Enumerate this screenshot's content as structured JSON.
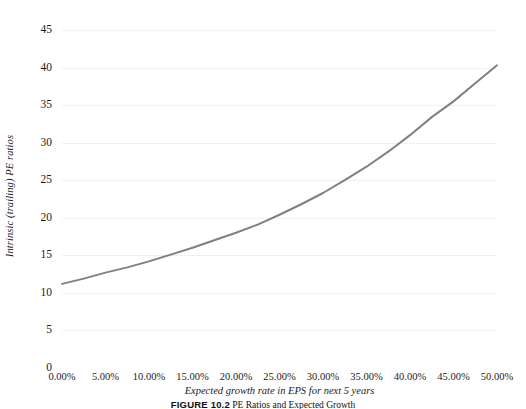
{
  "figure": {
    "caption_number": "FIGURE 10.2",
    "caption_text": "PE Ratios and Expected Growth"
  },
  "chart_data": {
    "type": "line",
    "title": "",
    "xlabel": "Expected growth rate in EPS for next 5 years",
    "ylabel": "Intrinsic (trailing) PE ratios",
    "xlim": [
      0,
      50
    ],
    "ylim": [
      0,
      45
    ],
    "grid": true,
    "legend": "none",
    "line_color": "#808080",
    "x_tick_labels": [
      "0.00%",
      "5.00%",
      "10.00%",
      "15.00%",
      "20.00%",
      "25.00%",
      "30.00%",
      "35.00%",
      "40.00%",
      "45.00%",
      "50.00%"
    ],
    "y_tick_labels": [
      "0",
      "5",
      "10",
      "15",
      "20",
      "25",
      "30",
      "35",
      "40",
      "45"
    ],
    "x": [
      0,
      2.5,
      5,
      7.5,
      10,
      12.5,
      15,
      17.5,
      20,
      22.5,
      25,
      27.5,
      30,
      32.5,
      35,
      37.5,
      40,
      42.5,
      45,
      47.5,
      50
    ],
    "series": [
      {
        "name": "Intrinsic (trailing) PE ratio",
        "values": [
          11.2,
          11.9,
          12.7,
          13.4,
          14.2,
          15.1,
          16.0,
          17.0,
          18.0,
          19.1,
          20.4,
          21.8,
          23.3,
          25.0,
          26.8,
          28.8,
          31.0,
          33.4,
          35.5,
          37.9,
          40.3
        ]
      }
    ]
  }
}
